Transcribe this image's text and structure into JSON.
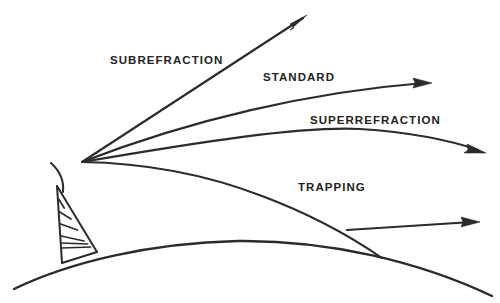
{
  "figure": {
    "kind": "radio-wave-propagation-diagram",
    "background_color": "#ffffff",
    "ink_color": "#2b2b2b"
  },
  "labels": {
    "subrefraction": "SUBREFRACTION",
    "standard": "STANDARD",
    "superrefraction": "SUPERREFRACTION",
    "trapping": "TRAPPING"
  },
  "label_positions": {
    "subrefraction": {
      "x": 110,
      "y": 64
    },
    "standard": {
      "x": 263,
      "y": 81
    },
    "superrefraction": {
      "x": 310,
      "y": 124
    },
    "trapping": {
      "x": 298,
      "y": 191
    }
  },
  "geometry": {
    "origin": {
      "x": 82,
      "y": 162
    },
    "rays": [
      {
        "name": "subrefraction-ray",
        "label": "SUBREFRACTION",
        "path": "M82,162 L303,18",
        "arrow_tip": {
          "x": 307,
          "y": 15
        },
        "arrow_angle_deg": -33.1,
        "curvature": "straight"
      },
      {
        "name": "standard-ray",
        "label": "STANDARD",
        "path": "M82,162 C190,120 310,92 424,83",
        "arrow_tip": {
          "x": 432,
          "y": 83
        },
        "arrow_angle_deg": -3.0,
        "curvature": "slight-downward"
      },
      {
        "name": "superrefraction-ray",
        "label": "SUPERREFRACTION",
        "path": "M82,162 C200,142 300,126 360,129 C420,133 455,142 478,150",
        "arrow_tip": {
          "x": 486,
          "y": 153
        },
        "arrow_angle_deg": 19.0,
        "curvature": "downward-bending"
      },
      {
        "name": "trapping-ray",
        "label": "TRAPPING",
        "path": "M82,162 C150,163 210,176 262,196 C310,214 350,236 382,258",
        "arrow_tip": null,
        "curvature": "strong-downward",
        "earth_crossing": {
          "x": 347,
          "y": 230
        }
      },
      {
        "name": "trapped-duct-ray",
        "label": "TRAPPING",
        "path": "M347,230 L472,222",
        "arrow_tip": {
          "x": 480,
          "y": 222
        },
        "arrow_angle_deg": -3.5,
        "curvature": "straight-along-surface"
      }
    ],
    "earth": {
      "name": "earth-surface",
      "path": "M14,289 C70,262 150,243 238,241 C330,240 420,262 492,296"
    },
    "tower": {
      "apex": {
        "x": 57,
        "y": 186
      },
      "base_left": {
        "x": 62,
        "y": 263
      },
      "base_right": {
        "x": 97,
        "y": 252
      },
      "rung_count": 6,
      "reflector_arc": "M51,163 C61,172 64,182 63,192"
    }
  }
}
